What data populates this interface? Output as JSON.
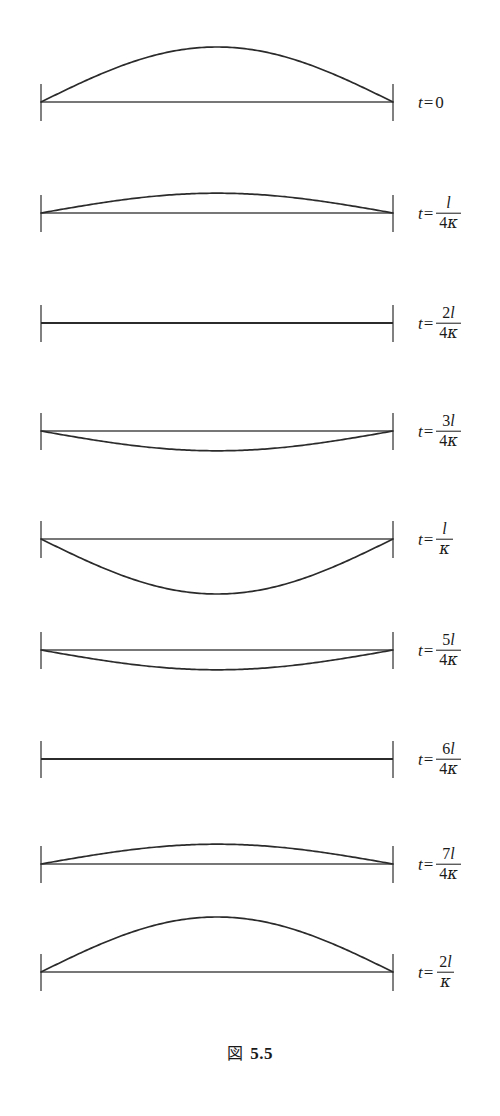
{
  "figure": {
    "caption_kanji": "図",
    "caption_number": "5.5",
    "caption_full": "図 5.5",
    "stroke_color": "#2b2b2b",
    "baseline_color": "#4a4a4a",
    "background_color": "#ffffff"
  },
  "geometry": {
    "left_x": 41,
    "right_x": 393,
    "baseline_y": 56,
    "tick_top_offset": 18,
    "tick_bottom_offset": 19,
    "max_amplitude_px": 55,
    "panel_height": 112,
    "panel_count": 9
  },
  "chart_data": {
    "type": "line",
    "xlabel": "",
    "ylabel": "",
    "x": [
      0,
      0.05,
      0.1,
      0.15,
      0.2,
      0.25,
      0.3,
      0.35,
      0.4,
      0.45,
      0.5,
      0.55,
      0.6,
      0.65,
      0.7,
      0.75,
      0.8,
      0.85,
      0.9,
      0.95,
      1.0
    ],
    "xlim": [
      0,
      1
    ],
    "ylim": [
      -1,
      1
    ],
    "grid": false,
    "legend": "right",
    "series": [
      {
        "name": "t=0",
        "label_t": "t",
        "label_eq": "=",
        "label_value": "0",
        "label_numerator": "",
        "label_denominator": "",
        "amplitude": 1.0,
        "values": [
          0,
          0.156,
          0.309,
          0.454,
          0.588,
          0.707,
          0.809,
          0.891,
          0.951,
          0.988,
          1.0,
          0.988,
          0.951,
          0.891,
          0.809,
          0.707,
          0.588,
          0.454,
          0.309,
          0.156,
          0
        ]
      },
      {
        "name": "t=l/4κ",
        "label_t": "t",
        "label_eq": "=",
        "label_value": "",
        "label_numerator": "l",
        "label_num_coef": "",
        "label_denominator": "κ",
        "label_den_coef": "4",
        "amplitude": 0.36,
        "values": [
          0,
          0.056,
          0.111,
          0.164,
          0.212,
          0.255,
          0.291,
          0.321,
          0.342,
          0.356,
          0.36,
          0.356,
          0.342,
          0.321,
          0.291,
          0.255,
          0.212,
          0.164,
          0.111,
          0.056,
          0
        ]
      },
      {
        "name": "t=2l/4κ",
        "label_t": "t",
        "label_eq": "=",
        "label_value": "",
        "label_numerator": "l",
        "label_num_coef": "2",
        "label_denominator": "κ",
        "label_den_coef": "4",
        "amplitude": 0.0,
        "values": [
          0,
          0,
          0,
          0,
          0,
          0,
          0,
          0,
          0,
          0,
          0,
          0,
          0,
          0,
          0,
          0,
          0,
          0,
          0,
          0,
          0
        ]
      },
      {
        "name": "t=3l/4κ",
        "label_t": "t",
        "label_eq": "=",
        "label_value": "",
        "label_numerator": "l",
        "label_num_coef": "3",
        "label_denominator": "κ",
        "label_den_coef": "4",
        "amplitude": -0.36,
        "values": [
          0,
          -0.056,
          -0.111,
          -0.164,
          -0.212,
          -0.255,
          -0.291,
          -0.321,
          -0.342,
          -0.356,
          -0.36,
          -0.356,
          -0.342,
          -0.321,
          -0.291,
          -0.255,
          -0.212,
          -0.164,
          -0.111,
          -0.056,
          0
        ]
      },
      {
        "name": "t=l/κ",
        "label_t": "t",
        "label_eq": "=",
        "label_value": "",
        "label_numerator": "l",
        "label_num_coef": "",
        "label_denominator": "κ",
        "label_den_coef": "",
        "amplitude": -1.0,
        "values": [
          0,
          -0.156,
          -0.309,
          -0.454,
          -0.588,
          -0.707,
          -0.809,
          -0.891,
          -0.951,
          -0.988,
          -1.0,
          -0.988,
          -0.951,
          -0.891,
          -0.809,
          -0.707,
          -0.588,
          -0.454,
          -0.309,
          -0.156,
          0
        ]
      },
      {
        "name": "t=5l/4κ",
        "label_t": "t",
        "label_eq": "=",
        "label_value": "",
        "label_numerator": "l",
        "label_num_coef": "5",
        "label_denominator": "κ",
        "label_den_coef": "4",
        "amplitude": -0.36,
        "values": [
          0,
          -0.056,
          -0.111,
          -0.164,
          -0.212,
          -0.255,
          -0.291,
          -0.321,
          -0.342,
          -0.356,
          -0.36,
          -0.356,
          -0.342,
          -0.321,
          -0.291,
          -0.255,
          -0.212,
          -0.164,
          -0.111,
          -0.056,
          0
        ]
      },
      {
        "name": "t=6l/4κ",
        "label_t": "t",
        "label_eq": "=",
        "label_value": "",
        "label_numerator": "l",
        "label_num_coef": "6",
        "label_denominator": "κ",
        "label_den_coef": "4",
        "amplitude": 0.0,
        "values": [
          0,
          0,
          0,
          0,
          0,
          0,
          0,
          0,
          0,
          0,
          0,
          0,
          0,
          0,
          0,
          0,
          0,
          0,
          0,
          0,
          0
        ]
      },
      {
        "name": "t=7l/4κ",
        "label_t": "t",
        "label_eq": "=",
        "label_value": "",
        "label_numerator": "l",
        "label_num_coef": "7",
        "label_denominator": "κ",
        "label_den_coef": "4",
        "amplitude": 0.36,
        "values": [
          0,
          0.056,
          0.111,
          0.164,
          0.212,
          0.255,
          0.291,
          0.321,
          0.342,
          0.356,
          0.36,
          0.356,
          0.342,
          0.321,
          0.291,
          0.255,
          0.212,
          0.164,
          0.111,
          0.056,
          0
        ]
      },
      {
        "name": "t=2l/κ",
        "label_t": "t",
        "label_eq": "=",
        "label_value": "",
        "label_numerator": "l",
        "label_num_coef": "2",
        "label_denominator": "κ",
        "label_den_coef": "",
        "amplitude": 1.0,
        "values": [
          0,
          0.156,
          0.309,
          0.454,
          0.588,
          0.707,
          0.809,
          0.891,
          0.951,
          0.988,
          1.0,
          0.988,
          0.951,
          0.891,
          0.809,
          0.707,
          0.588,
          0.454,
          0.309,
          0.156,
          0
        ]
      }
    ]
  },
  "panels": [
    {
      "index": 0,
      "top": 46
    },
    {
      "index": 1,
      "top": 157
    },
    {
      "index": 2,
      "top": 267
    },
    {
      "index": 3,
      "top": 375
    },
    {
      "index": 4,
      "top": 483
    },
    {
      "index": 5,
      "top": 594
    },
    {
      "index": 6,
      "top": 703
    },
    {
      "index": 7,
      "top": 808
    },
    {
      "index": 8,
      "top": 916
    }
  ]
}
